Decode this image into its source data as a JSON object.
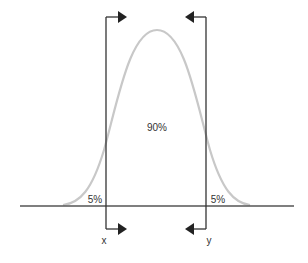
{
  "diagram": {
    "type": "normal-distribution-confidence-interval",
    "center_label": "90%",
    "left_tail_label": "5%",
    "right_tail_label": "5%",
    "left_bound_label": "x",
    "right_bound_label": "y",
    "colors": {
      "curve": "#c8c8c8",
      "lines": "#333333",
      "baseline": "#555555",
      "text": "#333333",
      "background": "#ffffff"
    }
  }
}
